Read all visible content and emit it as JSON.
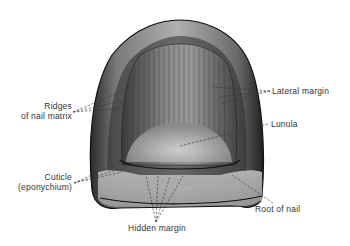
{
  "figure": {
    "labels": {
      "ridges": [
        "Ridges",
        "of nail matrix"
      ],
      "cuticle": [
        "Cuticle",
        "(eponychium)"
      ],
      "lateral_margin": "Lateral margin",
      "lunula": "Lunula",
      "root_of_nail": "Root of nail",
      "hidden_margin": "Hidden margin"
    },
    "colors": {
      "background": "#ffffff",
      "ink": "#1a1a1a",
      "label_text": "#333333"
    }
  }
}
